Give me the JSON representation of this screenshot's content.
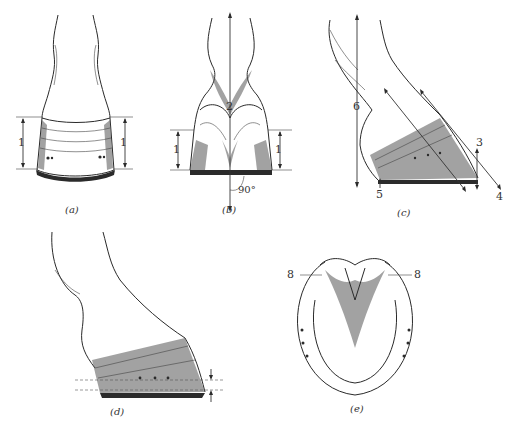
{
  "figure": {
    "panels": [
      {
        "id": "a",
        "caption": "(a)",
        "view": "front view of hoof",
        "labels": [
          "1",
          "1"
        ]
      },
      {
        "id": "b",
        "caption": "(b)",
        "view": "rear view of hoof",
        "labels": [
          "2",
          "1",
          "1"
        ],
        "angle": "90°"
      },
      {
        "id": "c",
        "caption": "(c)",
        "view": "side view of hoof",
        "labels": [
          "3",
          "4",
          "5",
          "6"
        ]
      },
      {
        "id": "d",
        "caption": "(d)",
        "view": "side view with nail line offset"
      },
      {
        "id": "e",
        "caption": "(e)",
        "view": "sole view with horseshoe",
        "labels": [
          "8",
          "8"
        ]
      }
    ]
  },
  "labels": {
    "a_left": "1",
    "a_right": "1",
    "b_center": "2",
    "b_left": "1",
    "b_right": "1",
    "b_angle": "90°",
    "c_three": "3",
    "c_four": "4",
    "c_five": "5",
    "c_six": "6",
    "e_left": "8",
    "e_right": "8"
  },
  "captions": {
    "a": "(a)",
    "b": "(b)",
    "c": "(c)",
    "d": "(d)",
    "e": "(e)"
  },
  "colors": {
    "ink": "#2a2a2a",
    "background": "#ffffff"
  }
}
